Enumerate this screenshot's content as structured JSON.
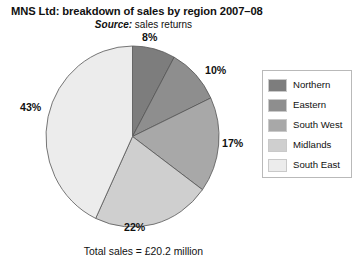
{
  "chart_data": {
    "type": "pie",
    "title": "MNS Ltd: breakdown of sales by region 2007–08",
    "subtitle_label": "Source:",
    "subtitle_value": " sales returns",
    "caption": "Total sales = £20.2 million",
    "xlabel": "",
    "ylabel": "",
    "grid": false,
    "legend_position": "right",
    "start_angle_deg": 0,
    "direction": "clockwise",
    "categories": [
      "Northern",
      "Eastern",
      "South West",
      "Midlands",
      "South East"
    ],
    "values": [
      8,
      10,
      17,
      22,
      43
    ],
    "value_labels": [
      "8%",
      "10%",
      "17%",
      "22%",
      "43%"
    ],
    "units": "percent",
    "colors": [
      "#7d7d7d",
      "#8e8e8e",
      "#a8a8a8",
      "#cfcfcf",
      "#ececec"
    ],
    "slice_edge_color": "#555555",
    "total_sales": "£20.2 million",
    "series": [
      {
        "name": "Share of sales 2007–08",
        "points": [
          {
            "label": "Northern",
            "value": 8,
            "value_label": "8%",
            "color": "#7d7d7d"
          },
          {
            "label": "Eastern",
            "value": 10,
            "value_label": "10%",
            "color": "#8e8e8e"
          },
          {
            "label": "South West",
            "value": 17,
            "value_label": "17%",
            "color": "#a8a8a8"
          },
          {
            "label": "Midlands",
            "value": 22,
            "value_label": "22%",
            "color": "#cfcfcf"
          },
          {
            "label": "South East",
            "value": 43,
            "value_label": "43%",
            "color": "#ececec"
          }
        ]
      }
    ]
  },
  "legend": {
    "items": [
      {
        "label": "Northern",
        "color": "#7d7d7d"
      },
      {
        "label": "Eastern",
        "color": "#8e8e8e"
      },
      {
        "label": "South West",
        "color": "#a8a8a8"
      },
      {
        "label": "Midlands",
        "color": "#cfcfcf"
      },
      {
        "label": "South East",
        "color": "#ececec"
      }
    ]
  }
}
